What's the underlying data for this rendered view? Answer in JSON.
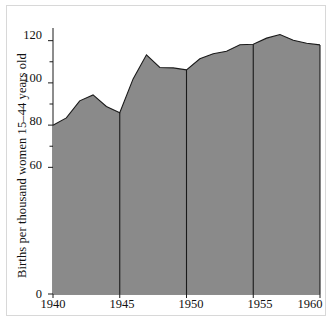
{
  "chart_data": {
    "type": "area",
    "title": "",
    "xlabel": "",
    "ylabel": "Births per thousand women 15–44 years old",
    "xlim": [
      1940,
      1960
    ],
    "ylim": [
      0,
      126
    ],
    "grid": false,
    "legend": null,
    "fill_color": "#8a8a8a",
    "line_color": "#1a1a1a",
    "x": [
      1940,
      1941,
      1942,
      1943,
      1944,
      1945,
      1946,
      1947,
      1948,
      1949,
      1950,
      1951,
      1952,
      1953,
      1954,
      1955,
      1956,
      1957,
      1958,
      1959,
      1960
    ],
    "values": [
      79.9,
      83.4,
      91.5,
      94.3,
      88.8,
      85.9,
      101.9,
      113.3,
      107.3,
      107.1,
      106.2,
      111.4,
      113.8,
      115.0,
      118.1,
      118.3,
      121.2,
      122.9,
      120.2,
      118.8,
      118.0
    ],
    "xticks": [
      1940,
      1945,
      1950,
      1955,
      1960
    ],
    "xtick_labels": [
      "1940",
      "1945",
      "1950",
      "1955",
      "1960"
    ],
    "yticks_major": [
      0,
      60,
      80,
      100,
      120
    ],
    "ytick_labels": [
      "0",
      "60",
      "80",
      "100",
      "120"
    ],
    "yticks_minor": [
      70,
      90,
      110
    ],
    "vertical_rules": [
      1945,
      1950,
      1955,
      1960
    ]
  }
}
